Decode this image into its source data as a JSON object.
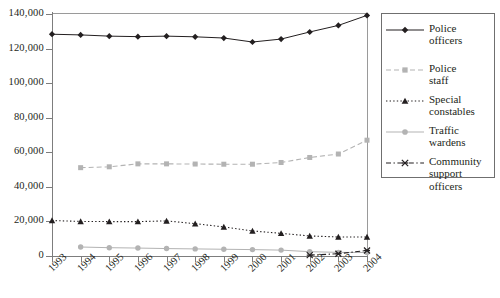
{
  "chart_data": {
    "type": "line",
    "title": "",
    "subtitle": "",
    "xlabel": "",
    "ylabel": "",
    "x": [
      1993,
      1994,
      1995,
      1996,
      1997,
      1998,
      1999,
      2000,
      2001,
      2002,
      2003,
      2004
    ],
    "categories": [
      "1993",
      "1994",
      "1995",
      "1996",
      "1997",
      "1998",
      "1999",
      "2000",
      "2001",
      "2002",
      "2003",
      "2004"
    ],
    "ylim": [
      0,
      140000
    ],
    "yticks": [
      0,
      20000,
      40000,
      60000,
      80000,
      100000,
      120000,
      140000
    ],
    "ytick_labels": [
      "0",
      "20,000",
      "40,000",
      "60,000",
      "80,000",
      "100,000",
      "120,000",
      "140,000"
    ],
    "grid": false,
    "legend_position": "right",
    "series": [
      {
        "name": "Police officers",
        "label_lines": [
          "Police",
          "officers"
        ],
        "color": "#231f20",
        "marker": "diamond",
        "line_style": "solid",
        "values": [
          128300,
          127900,
          127200,
          126900,
          127200,
          126800,
          126100,
          123800,
          125500,
          129600,
          133400,
          139200
        ]
      },
      {
        "name": "Police staff",
        "label_lines": [
          "Police",
          "staff"
        ],
        "color": "#b3b3b3",
        "marker": "square",
        "line_style": "dashed",
        "values": [
          null,
          51100,
          51600,
          53300,
          53300,
          53200,
          53100,
          53100,
          54100,
          57000,
          59000,
          67000
        ]
      },
      {
        "name": "Special constables",
        "label_lines": [
          "Special",
          "constables"
        ],
        "color": "#231f20",
        "marker": "triangle",
        "line_style": "dotted",
        "values": [
          20500,
          20000,
          19900,
          19900,
          20300,
          18700,
          16800,
          14500,
          13100,
          11600,
          11000,
          11000
        ]
      },
      {
        "name": "Traffic wardens",
        "label_lines": [
          "Traffic",
          "wardens"
        ],
        "color": "#b3b3b3",
        "marker": "circle",
        "line_style": "solid",
        "values": [
          null,
          5200,
          4800,
          4600,
          4300,
          4100,
          3900,
          3700,
          3400,
          2500,
          2100,
          2000
        ]
      },
      {
        "name": "Community support officers",
        "label_lines": [
          "Community",
          "support",
          "officers"
        ],
        "color": "#231f20",
        "marker": "x",
        "line_style": "dashdot",
        "values": [
          null,
          null,
          null,
          null,
          null,
          null,
          null,
          null,
          null,
          500,
          1300,
          3200
        ]
      }
    ]
  },
  "axes": {
    "y_labels": [
      "140,000",
      "120,000",
      "100,000",
      "80,000",
      "60,000",
      "40,000",
      "20,000",
      "0"
    ],
    "x_labels": [
      "1993",
      "1994",
      "1995",
      "1996",
      "1997",
      "1998",
      "1999",
      "2000",
      "2001",
      "2002",
      "2003",
      "2004"
    ]
  },
  "legend": {
    "entries": [
      {
        "lines": [
          "Police",
          "officers"
        ]
      },
      {
        "lines": [
          "Police",
          "staff"
        ]
      },
      {
        "lines": [
          "Special",
          "constables"
        ]
      },
      {
        "lines": [
          "Traffic",
          "wardens"
        ]
      },
      {
        "lines": [
          "Community",
          "support",
          "officers"
        ]
      }
    ]
  },
  "colors": {
    "dark": "#231f20",
    "light": "#b3b3b3",
    "axis": "#7d7d7d",
    "frame": "#9a9a9a"
  }
}
